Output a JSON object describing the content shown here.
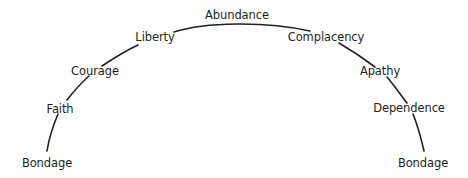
{
  "diagram": {
    "line_color": "#231f20",
    "stages": [
      {
        "label": "Bondage"
      },
      {
        "label": "Faith"
      },
      {
        "label": "Courage"
      },
      {
        "label": "Liberty"
      },
      {
        "label": "Abundance"
      },
      {
        "label": "Complacency"
      },
      {
        "label": "Apathy"
      },
      {
        "label": "Dependence"
      },
      {
        "label": "Bondage"
      }
    ]
  }
}
